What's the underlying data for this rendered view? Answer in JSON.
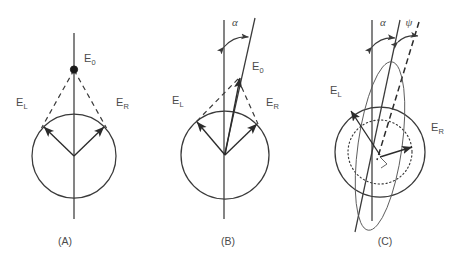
{
  "figure": {
    "background_color": "#ffffff",
    "line_color": "#3a3a3a",
    "label_color": "#4a4a4a",
    "width": 466,
    "height": 253
  },
  "panels": [
    {
      "id": "A",
      "caption": "(A)",
      "labels": {
        "e0": "E",
        "e0_sub": "0",
        "el": "E",
        "el_sub": "L",
        "er": "E",
        "er_sub": "R"
      },
      "elements": {
        "circle": "unit-circle",
        "axis": "vertical-axis",
        "resultant_marker": "filled-dot",
        "dashed_construction": "dashed-connector-lines",
        "vectors": [
          "E_L",
          "E_R"
        ]
      },
      "angles": []
    },
    {
      "id": "B",
      "caption": "(B)",
      "labels": {
        "e0": "E",
        "e0_sub": "0",
        "el": "E",
        "el_sub": "L",
        "er": "E",
        "er_sub": "R",
        "alpha": "α"
      },
      "elements": {
        "circle": "unit-circle",
        "axis": "vertical-axis",
        "rotated_axis": "tilted-axis",
        "dashed_construction": "dashed-connector-lines",
        "vectors": [
          "E_L",
          "E_R",
          "E_0"
        ]
      },
      "angles": [
        {
          "symbol": "α",
          "name": "alpha",
          "between": [
            "vertical-axis",
            "tilted-axis"
          ]
        }
      ]
    },
    {
      "id": "C",
      "caption": "(C)",
      "labels": {
        "el": "E",
        "el_sub": "L",
        "er": "E",
        "er_sub": "R",
        "alpha": "α",
        "psi": "ψ"
      },
      "elements": {
        "outer_circle": "solid-circle",
        "inner_circle": "dotted-circle",
        "ellipse": "polarization-ellipse",
        "axis": "vertical-axis",
        "rotated_axis": "tilted-axis",
        "dashed_axis": "dashed-tilted-axis",
        "right_angle_mark": "right-angle-tick",
        "vectors": [
          "E_L",
          "E_R"
        ]
      },
      "angles": [
        {
          "symbol": "α",
          "name": "alpha",
          "between": [
            "vertical-axis",
            "tilted-axis"
          ]
        },
        {
          "symbol": "ψ",
          "name": "psi",
          "between": [
            "tilted-axis",
            "dashed-tilted-axis"
          ]
        }
      ]
    }
  ]
}
